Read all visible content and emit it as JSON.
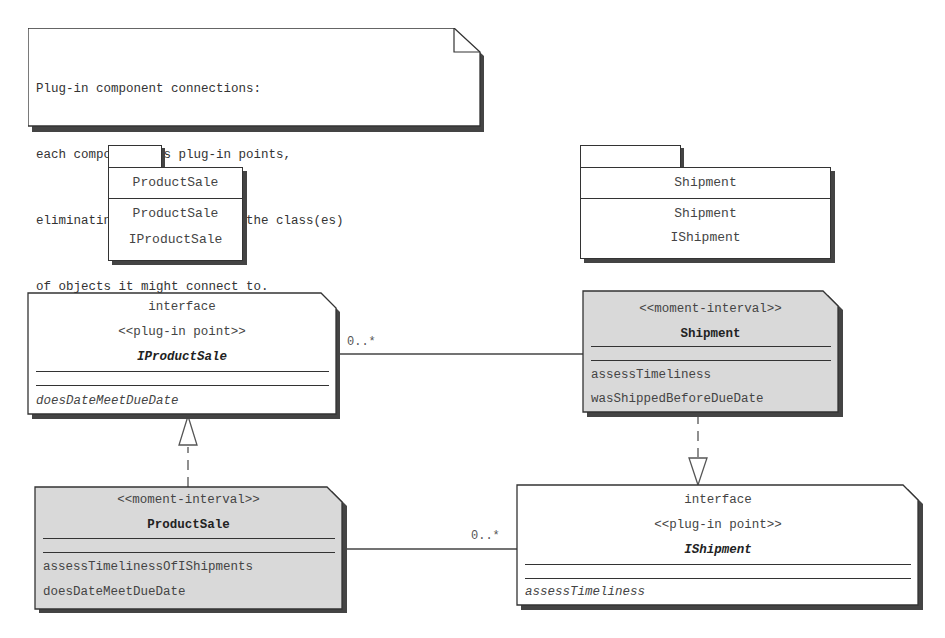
{
  "note": {
    "lines": [
      "Plug-in component connections:",
      "each component has plug-in points,",
      "eliminating needing to know the class(es)",
      "of objects it might connect to."
    ]
  },
  "packages": [
    {
      "id": "productsale-package",
      "title": "ProductSale",
      "items": [
        "ProductSale",
        "IProductSale"
      ]
    },
    {
      "id": "shipment-package",
      "title": "Shipment",
      "items": [
        "Shipment",
        "IShipment"
      ]
    }
  ],
  "classes": {
    "iproductsale": {
      "keyword": "interface",
      "stereotype": "<<plug-in point>>",
      "name": "IProductSale",
      "operations": [
        "doesDateMeetDueDate"
      ],
      "fill": "#ffffff"
    },
    "shipment": {
      "stereotype": "<<moment-interval>>",
      "name": "Shipment",
      "operations": [
        "assessTimeliness",
        "wasShippedBeforeDueDate"
      ],
      "fill": "#d9d9d9"
    },
    "productsale": {
      "stereotype": "<<moment-interval>>",
      "name": "ProductSale",
      "operations": [
        "assessTimelinessOfIShipments",
        "doesDateMeetDueDate"
      ],
      "fill": "#d9d9d9"
    },
    "ishipment": {
      "keyword": "interface",
      "stereotype": "<<plug-in point>>",
      "name": "IShipment",
      "operations": [
        "assessTimeliness"
      ],
      "fill": "#ffffff"
    }
  },
  "associations": [
    {
      "from": "IProductSale",
      "to": "Shipment",
      "multiplicity": "0..*"
    },
    {
      "from": "ProductSale",
      "to": "IShipment",
      "multiplicity": "0..*"
    }
  ],
  "realizations": [
    {
      "from": "ProductSale",
      "to": "IProductSale"
    },
    {
      "from": "Shipment",
      "to": "IShipment"
    }
  ]
}
